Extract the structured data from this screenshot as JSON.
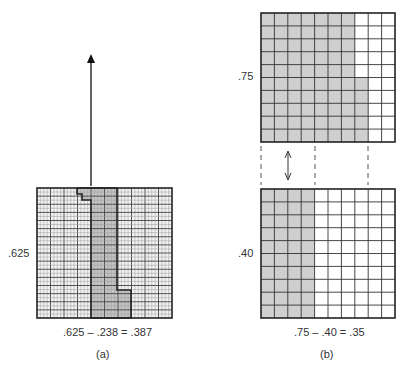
{
  "panel_a": {
    "caption": "(a)",
    "side_label": ".625",
    "equation": ".625 – .238 = .387",
    "grid": {
      "x": 37,
      "y": 188,
      "w": 135,
      "h": 130,
      "major_cols": 10,
      "minor_per_col": 4,
      "major_rows": 16,
      "minor_per_row": 2
    },
    "arrow": {
      "x": 91,
      "y_top": 54,
      "y_bottom": 186
    },
    "colors": {
      "grid_bg": "#f2f2f2",
      "shade": "#c4c4c4",
      "line": "#444444",
      "minor": "#9a9a9a"
    }
  },
  "panel_b": {
    "caption": "(b)",
    "top": {
      "side_label": ".75",
      "x": 261,
      "y": 13,
      "w": 134,
      "h": 129,
      "cols": 10,
      "rows": 10,
      "full_cols": 7,
      "partial_col_cells_from_bottom": 5
    },
    "bottom": {
      "side_label": ".40",
      "x": 261,
      "y": 189,
      "w": 134,
      "h": 129,
      "cols": 10,
      "rows": 10,
      "full_cols": 4
    },
    "equation": ".75 – .40 = .35",
    "dashed_x": [
      261,
      315,
      368
    ],
    "double_arrow_x": 288,
    "colors": {
      "shade": "#cfcfcf",
      "line": "#333333",
      "bg": "#ffffff"
    }
  }
}
